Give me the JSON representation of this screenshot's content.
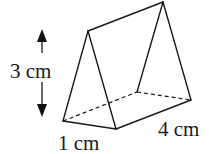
{
  "diagram": {
    "type": "triangular-prism",
    "labels": {
      "height": "3 cm",
      "base_width": "1 cm",
      "length": "4 cm"
    },
    "vertices": {
      "front_apex": [
        88,
        31
      ],
      "front_bottom_left": [
        63,
        121
      ],
      "front_bottom_right": [
        116,
        129
      ],
      "back_apex": [
        163,
        2
      ],
      "back_bottom_left": [
        137,
        92
      ],
      "back_bottom_right": [
        191,
        100
      ]
    },
    "colors": {
      "stroke": "#1a1a1a",
      "background": "#ffffff"
    }
  }
}
